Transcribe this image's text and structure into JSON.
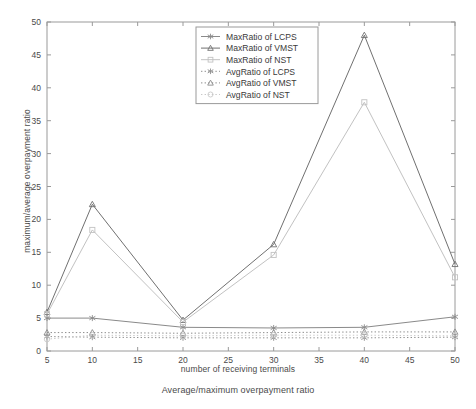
{
  "chart_data": {
    "type": "line",
    "title": "",
    "xlabel": "number of receiving terminals",
    "ylabel": "maximum/average overpayment ratio",
    "caption": "Average/maximum overpayment ratio",
    "x": [
      5,
      10,
      20,
      30,
      40,
      50
    ],
    "xlim": [
      5,
      50
    ],
    "ylim": [
      0,
      50
    ],
    "xticks": [
      5,
      10,
      15,
      20,
      25,
      30,
      35,
      40,
      45,
      50
    ],
    "yticks": [
      0,
      5,
      10,
      15,
      20,
      25,
      30,
      35,
      40,
      45,
      50
    ],
    "xticklabels": [
      "5",
      "10",
      "15",
      "20",
      "25",
      "30",
      "35",
      "40",
      "45",
      "50"
    ],
    "yticklabels": [
      "0",
      "5",
      "10",
      "15",
      "20",
      "25",
      "30",
      "35",
      "40",
      "45",
      "50"
    ],
    "grid": false,
    "legend_position": "upper center",
    "series": [
      {
        "name": "MaxRatio of LCPS",
        "values": [
          5.0,
          5.0,
          3.6,
          3.5,
          3.6,
          5.2
        ],
        "color": "#8a8a8a",
        "linestyle": "solid",
        "marker": "asterisk"
      },
      {
        "name": "MaxRatio of VMST",
        "values": [
          5.9,
          22.3,
          4.7,
          16.2,
          48.0,
          13.2
        ],
        "color": "#707070",
        "linestyle": "solid",
        "marker": "triangle"
      },
      {
        "name": "MaxRatio of NST",
        "values": [
          5.6,
          18.4,
          4.4,
          14.6,
          37.8,
          11.2
        ],
        "color": "#c2c2c2",
        "linestyle": "solid",
        "marker": "square"
      },
      {
        "name": "AvgRatio of LCPS",
        "values": [
          2.2,
          2.1,
          2.0,
          2.0,
          2.0,
          2.1
        ],
        "color": "#909090",
        "linestyle": "dotted",
        "marker": "asterisk"
      },
      {
        "name": "AvgRatio of VMST",
        "values": [
          2.8,
          2.8,
          2.7,
          2.8,
          2.9,
          2.9
        ],
        "color": "#8c8c8c",
        "linestyle": "dotted",
        "marker": "triangle"
      },
      {
        "name": "AvgRatio of NST",
        "values": [
          1.8,
          2.4,
          2.3,
          2.4,
          2.4,
          2.3
        ],
        "color": "#c8c8c8",
        "linestyle": "dotted",
        "marker": "circle"
      }
    ]
  }
}
